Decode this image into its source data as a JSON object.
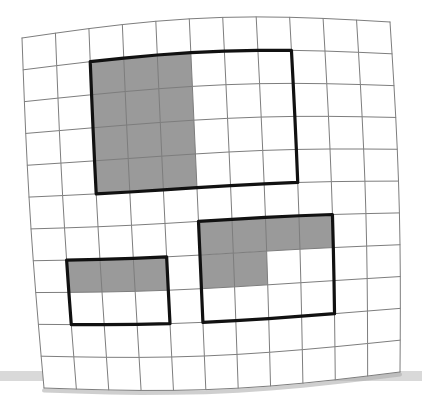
{
  "figure": {
    "kind": "grid-paper-fraction-diagram",
    "grid": {
      "columns": 11,
      "rows": 11,
      "cell_fill": "#ffffff",
      "line_color": "#7d7d7d",
      "line_width": 1.0,
      "sheet_corners": {
        "top_left": [
          22,
          38
        ],
        "top_right": [
          390,
          22
        ],
        "bottom_right": [
          400,
          372
        ],
        "bottom_left": [
          44,
          388
        ]
      },
      "top_edge_bow": -12,
      "bottom_edge_bow": 9,
      "left_edge_bow": -3,
      "right_edge_bow": 4
    },
    "shaded_color": "#9a9a9a",
    "outline_color": "#111111",
    "outline_width": 3.2,
    "regions": [
      {
        "id": "region-top-left",
        "label": "top-left rectangle",
        "col_start": 2,
        "row_start": 1,
        "col_span": 6,
        "row_span": 4,
        "total_cells": 24,
        "shaded_cells": 12,
        "fraction": "12/24",
        "shaded_block": {
          "col_start": 2,
          "row_start": 1,
          "col_span": 3,
          "row_span": 4
        }
      },
      {
        "id": "region-bottom-left",
        "label": "bottom-left rectangle",
        "col_start": 1,
        "row_start": 7,
        "col_span": 3,
        "row_span": 2,
        "total_cells": 6,
        "shaded_cells": 3,
        "fraction": "3/6",
        "shaded_block": {
          "col_start": 1,
          "row_start": 7,
          "col_span": 3,
          "row_span": 1
        }
      },
      {
        "id": "region-bottom-right",
        "label": "bottom-right rectangle",
        "col_start": 5,
        "row_start": 6,
        "col_span": 4,
        "row_span": 3,
        "total_cells": 12,
        "shaded_cells": 6,
        "fraction": "6/12",
        "shaded_blocks": [
          {
            "col_start": 5,
            "row_start": 6,
            "col_span": 4,
            "row_span": 1
          },
          {
            "col_start": 5,
            "row_start": 7,
            "col_span": 2,
            "row_span": 1
          }
        ]
      }
    ],
    "surface": {
      "label": "table surface shadow band",
      "color": "#b9b9b9",
      "y": 371,
      "height": 10,
      "x": 0,
      "width": 422
    },
    "sheet_shadow_color": "#a8a8a8"
  }
}
